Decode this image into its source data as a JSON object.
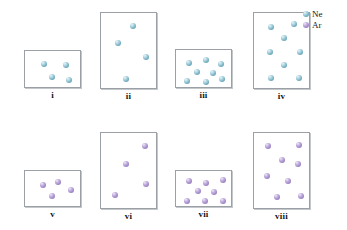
{
  "figure": {
    "legend": {
      "position": "top-right",
      "entries": [
        {
          "label": "Ne",
          "color": "#6fa9bd",
          "icon": "sphere-icon"
        },
        {
          "label": "Ar",
          "color": "#9b85c4",
          "icon": "sphere-icon"
        }
      ]
    },
    "boxes": [
      {
        "label": "i",
        "gas": "Ne",
        "color": "#6fa9bd",
        "count": 4,
        "rect": {
          "x": 24,
          "y": 50,
          "w": 57,
          "h": 38
        },
        "label_y": 90,
        "particles": [
          {
            "x": 16,
            "y": 10
          },
          {
            "x": 38,
            "y": 11
          },
          {
            "x": 24,
            "y": 23
          },
          {
            "x": 41,
            "y": 26
          }
        ]
      },
      {
        "label": "ii",
        "gas": "Ne",
        "color": "#6fa9bd",
        "count": 4,
        "rect": {
          "x": 100,
          "y": 12,
          "w": 57,
          "h": 77
        },
        "label_y": 91,
        "particles": [
          {
            "x": 29,
            "y": 10
          },
          {
            "x": 14,
            "y": 27
          },
          {
            "x": 42,
            "y": 41
          },
          {
            "x": 22,
            "y": 63
          }
        ]
      },
      {
        "label": "iii",
        "gas": "Ne",
        "color": "#6fa9bd",
        "count": 8,
        "rect": {
          "x": 175,
          "y": 49,
          "w": 57,
          "h": 39
        },
        "label_y": 90,
        "particles": [
          {
            "x": 10,
            "y": 10
          },
          {
            "x": 27,
            "y": 7
          },
          {
            "x": 42,
            "y": 11
          },
          {
            "x": 18,
            "y": 19
          },
          {
            "x": 34,
            "y": 20
          },
          {
            "x": 8,
            "y": 28
          },
          {
            "x": 27,
            "y": 29
          },
          {
            "x": 43,
            "y": 26
          }
        ]
      },
      {
        "label": "iv",
        "gas": "Ne",
        "color": "#6fa9bd",
        "count": 8,
        "rect": {
          "x": 253,
          "y": 12,
          "w": 57,
          "h": 77
        },
        "label_y": 91,
        "particles": [
          {
            "x": 14,
            "y": 11
          },
          {
            "x": 37,
            "y": 8
          },
          {
            "x": 27,
            "y": 22
          },
          {
            "x": 13,
            "y": 36
          },
          {
            "x": 43,
            "y": 36
          },
          {
            "x": 27,
            "y": 49
          },
          {
            "x": 14,
            "y": 62
          },
          {
            "x": 42,
            "y": 62
          }
        ]
      },
      {
        "label": "v",
        "gas": "Ar",
        "color": "#9b85c4",
        "count": 4,
        "rect": {
          "x": 24,
          "y": 170,
          "w": 57,
          "h": 37
        },
        "label_y": 209,
        "particles": [
          {
            "x": 15,
            "y": 11
          },
          {
            "x": 30,
            "y": 8
          },
          {
            "x": 43,
            "y": 16
          },
          {
            "x": 24,
            "y": 22
          }
        ]
      },
      {
        "label": "vi",
        "gas": "Ar",
        "color": "#9b85c4",
        "count": 4,
        "rect": {
          "x": 100,
          "y": 132,
          "w": 57,
          "h": 77
        },
        "label_y": 211,
        "particles": [
          {
            "x": 41,
            "y": 10
          },
          {
            "x": 22,
            "y": 28
          },
          {
            "x": 42,
            "y": 48
          },
          {
            "x": 11,
            "y": 59
          }
        ]
      },
      {
        "label": "vii",
        "gas": "Ar",
        "color": "#9b85c4",
        "count": 8,
        "rect": {
          "x": 175,
          "y": 170,
          "w": 57,
          "h": 37
        },
        "label_y": 209,
        "particles": [
          {
            "x": 10,
            "y": 7
          },
          {
            "x": 27,
            "y": 9
          },
          {
            "x": 44,
            "y": 6
          },
          {
            "x": 19,
            "y": 17
          },
          {
            "x": 35,
            "y": 18
          },
          {
            "x": 8,
            "y": 27
          },
          {
            "x": 26,
            "y": 27
          },
          {
            "x": 44,
            "y": 27
          }
        ]
      },
      {
        "label": "viii",
        "gas": "Ar",
        "color": "#9b85c4",
        "count": 8,
        "rect": {
          "x": 253,
          "y": 132,
          "w": 57,
          "h": 77
        },
        "label_y": 211,
        "particles": [
          {
            "x": 11,
            "y": 10
          },
          {
            "x": 42,
            "y": 9
          },
          {
            "x": 25,
            "y": 24
          },
          {
            "x": 41,
            "y": 28
          },
          {
            "x": 10,
            "y": 40
          },
          {
            "x": 31,
            "y": 45
          },
          {
            "x": 20,
            "y": 61
          },
          {
            "x": 44,
            "y": 60
          }
        ]
      }
    ]
  }
}
